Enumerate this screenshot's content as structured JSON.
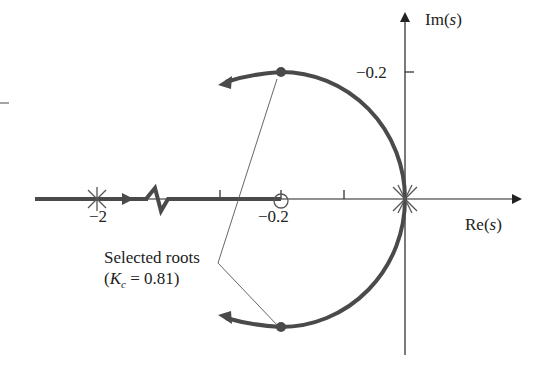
{
  "diagram": {
    "type": "root-locus",
    "axes": {
      "real_label_prefix": "Re",
      "real_label_var": "s",
      "imag_label_prefix": "Im",
      "imag_label_var": "s",
      "real_ticks": [
        {
          "label": "−2",
          "x": 97
        },
        {
          "label": "−0.2",
          "x": 281
        }
      ],
      "imag_ticks": [
        {
          "label": "−0.2",
          "y": 72
        }
      ]
    },
    "poles": [
      {
        "name": "pole-at-minus-2",
        "label": "−2"
      },
      {
        "name": "double-pole-at-origin",
        "label": "0"
      }
    ],
    "zeros": [
      {
        "name": "zero-at-minus-0.2",
        "label": "−0.2"
      }
    ],
    "annotation": {
      "line1": "Selected roots",
      "line2_open": "(",
      "line2_K": "K",
      "line2_sub": "c",
      "line2_rest": " = 0.81)"
    },
    "colors": {
      "locus": "#4a4a4a",
      "axis": "#222222",
      "text": "#222222",
      "background": "#ffffff"
    }
  }
}
